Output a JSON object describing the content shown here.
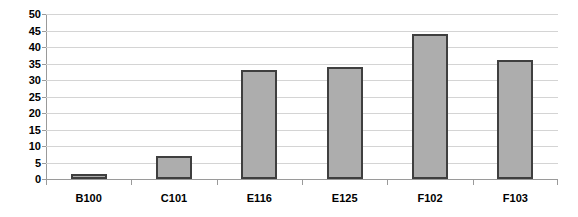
{
  "chart_data": {
    "type": "bar",
    "title": "",
    "xlabel": "",
    "ylabel": "",
    "categories": [
      "B100",
      "C101",
      "E116",
      "E125",
      "F102",
      "F103"
    ],
    "values": [
      1.5,
      7,
      33,
      34,
      44,
      36
    ],
    "ylim": [
      0,
      50
    ],
    "y_ticks": [
      0,
      5,
      10,
      15,
      20,
      25,
      30,
      35,
      40,
      45,
      50
    ],
    "y_tick_labels": [
      "0",
      "5",
      "10",
      "15",
      "20",
      "25",
      "30",
      "35",
      "40",
      "45",
      "50"
    ],
    "grid": true,
    "legend": false,
    "legend_position": "none",
    "colors": {
      "bar_fill": "#adadad",
      "bar_border": "#3f3f3f",
      "gridline": "#d4d4d4",
      "axis": "#9a9a9a",
      "background": "#ffffff",
      "text": "#000000"
    }
  }
}
